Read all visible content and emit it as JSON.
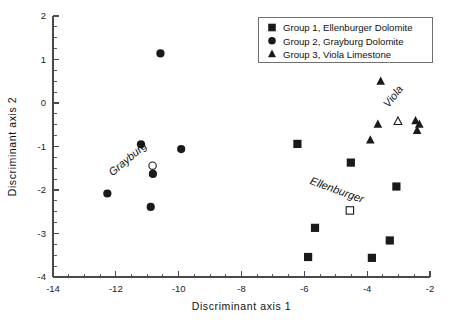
{
  "figure": {
    "background": "#ffffff",
    "foreground": "#1a1a1a"
  },
  "chart_data": {
    "type": "scatter",
    "title": "",
    "xlabel": "Discriminant axis 1",
    "ylabel": "Discriminant axis 2",
    "xlim": [
      -14,
      -2
    ],
    "ylim": [
      -4,
      2
    ],
    "xticks": [
      -14,
      -12,
      -10,
      -8,
      -6,
      -4,
      -2
    ],
    "yticks": [
      2,
      1,
      0,
      -1,
      -2,
      -3,
      -4
    ],
    "xtick_labels": [
      "-14",
      "-12",
      "-10",
      "-8",
      "-6",
      "-4",
      "-2"
    ],
    "ytick_labels": [
      "2",
      "1",
      "0",
      "-1",
      "-2",
      "-3",
      "-4"
    ],
    "xminor_step": 0.5,
    "yminor_step": 0.25,
    "grid": false,
    "legend_position": "top-right",
    "series": [
      {
        "name": "Group 1, Ellenburger Dolomite",
        "marker": "square",
        "fill": "filled",
        "color": "#1a1a1a",
        "points": [
          [
            -6.22,
            -0.94
          ],
          [
            -4.52,
            -1.37
          ],
          [
            -3.07,
            -1.92
          ],
          [
            -5.66,
            -2.87
          ],
          [
            -3.28,
            -3.16
          ],
          [
            -5.88,
            -3.54
          ],
          [
            -3.85,
            -3.56
          ]
        ]
      },
      {
        "name": "Group 2, Grayburg Dolomite",
        "marker": "circle",
        "fill": "filled",
        "color": "#1a1a1a",
        "points": [
          [
            -10.58,
            1.14
          ],
          [
            -11.2,
            -0.95
          ],
          [
            -9.92,
            -1.06
          ],
          [
            -10.82,
            -1.63
          ],
          [
            -12.27,
            -2.08
          ],
          [
            -10.89,
            -2.39
          ]
        ]
      },
      {
        "name": "Group 3, Viola Limestone",
        "marker": "triangle",
        "fill": "filled",
        "color": "#1a1a1a",
        "points": [
          [
            -3.57,
            0.5
          ],
          [
            -3.66,
            -0.49
          ],
          [
            -3.9,
            -0.85
          ],
          [
            -2.46,
            -0.41
          ],
          [
            -2.34,
            -0.49
          ],
          [
            -2.41,
            -0.63
          ]
        ]
      }
    ],
    "centroids": [
      {
        "name": "Ellenburger",
        "marker": "square",
        "fill": "open",
        "point": [
          -4.55,
          -2.47
        ],
        "label": "Ellenburger",
        "label_rotation": 20,
        "label_point": [
          -5.0,
          -2.08
        ]
      },
      {
        "name": "Grayburg",
        "marker": "circle",
        "fill": "open",
        "point": [
          -10.83,
          -1.44
        ],
        "label": "Grayburg",
        "label_rotation": -40,
        "label_point": [
          -11.55,
          -1.35
        ]
      },
      {
        "name": "Viola",
        "marker": "triangle",
        "fill": "open",
        "point": [
          -3.02,
          -0.42
        ],
        "label": "Viola",
        "label_rotation": -52,
        "label_point": [
          -3.08,
          0.1
        ]
      }
    ],
    "legend_entries": [
      {
        "label": "Group 1, Ellenburger Dolomite",
        "marker": "square"
      },
      {
        "label": "Group 2, Grayburg Dolomite",
        "marker": "circle"
      },
      {
        "label": "Group 3, Viola Limestone",
        "marker": "triangle"
      }
    ]
  }
}
